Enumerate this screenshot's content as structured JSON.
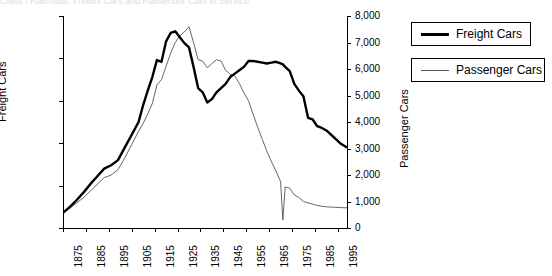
{
  "title_clipped": "Class I Railroads: Freight Cars and Passenger Cars in Service",
  "axes": {
    "left_title": "Freight Cars",
    "right_title": "Passenger Cars",
    "left_ticks": [
      "250,000",
      "200,000",
      "150,000",
      "100,000",
      "50,000",
      "0"
    ],
    "right_ticks": [
      "8,000",
      "7,000",
      "6,000",
      "5,000",
      "4,000",
      "3,000",
      "2,000",
      "1,000",
      "0"
    ],
    "x_ticks": [
      "1875",
      "1885",
      "1895",
      "1905",
      "1915",
      "1925",
      "1935",
      "1945",
      "1955",
      "1965",
      "1975",
      "1985",
      "1995"
    ]
  },
  "legend": {
    "items": [
      {
        "label": "Freight Cars",
        "swatch": "thick-black-line",
        "color": "#000000"
      },
      {
        "label": "Passenger Cars",
        "swatch": "thin-gray-line",
        "color": "#555555"
      }
    ]
  },
  "chart_data": {
    "type": "line",
    "title": "Class I Railroads: Freight Cars and Passenger Cars in Service",
    "xlabel": "",
    "ylabel": "Freight Cars",
    "y2label": "Passenger Cars",
    "xlim": [
      1875,
      1999
    ],
    "ylim": [
      0,
      250000
    ],
    "y2lim": [
      0,
      8000
    ],
    "grid": false,
    "legend_position": "right-outside",
    "x": [
      1875,
      1878,
      1881,
      1884,
      1887,
      1890,
      1893,
      1896,
      1899,
      1902,
      1905,
      1908,
      1910,
      1912,
      1914,
      1916,
      1918,
      1920,
      1922,
      1924,
      1926,
      1928,
      1930,
      1932,
      1934,
      1936,
      1938,
      1940,
      1942,
      1944,
      1946,
      1948,
      1950,
      1952,
      1954,
      1956,
      1958,
      1960,
      1962,
      1964,
      1966,
      1968,
      1970,
      1971,
      1972,
      1974,
      1976,
      1978,
      1980,
      1982,
      1984,
      1986,
      1988,
      1990,
      1992,
      1994,
      1996,
      1999
    ],
    "series": [
      {
        "name": "Freight Cars",
        "axis": "left",
        "style": "thick-black-line",
        "values": [
          18000,
          25000,
          33000,
          42000,
          52000,
          61000,
          70000,
          74000,
          80000,
          95000,
          110000,
          125000,
          145000,
          162000,
          178000,
          198000,
          196000,
          220000,
          230000,
          232000,
          225000,
          218000,
          213000,
          190000,
          165000,
          160000,
          148000,
          152000,
          160000,
          165000,
          170000,
          178000,
          182000,
          186000,
          190000,
          197000,
          197000,
          196000,
          195000,
          194000,
          195000,
          196000,
          194000,
          193000,
          190000,
          185000,
          170000,
          162000,
          155000,
          130000,
          128000,
          120000,
          118000,
          115000,
          110000,
          105000,
          100000,
          95000
        ]
      },
      {
        "name": "Passenger Cars",
        "axis": "right",
        "style": "thin-gray-line",
        "values": [
          600,
          750,
          950,
          1150,
          1400,
          1650,
          1900,
          2000,
          2200,
          2650,
          3150,
          3650,
          3950,
          4300,
          4700,
          5400,
          5600,
          6100,
          6600,
          7000,
          7250,
          7400,
          7600,
          7000,
          6350,
          6300,
          6050,
          6200,
          6350,
          6300,
          5950,
          5800,
          5750,
          5450,
          5100,
          4800,
          4300,
          3800,
          3350,
          2900,
          2500,
          2150,
          1750,
          300,
          1550,
          1500,
          1250,
          1150,
          1000,
          950,
          900,
          850,
          820,
          800,
          790,
          780,
          770,
          760
        ]
      }
    ],
    "annotations": [
      {
        "text": "Freight peak ~232,000 cars",
        "x": 1924
      },
      {
        "text": "Passenger peak ~7,600 cars",
        "x": 1930
      },
      {
        "text": "Freight trough ~148,000 cars",
        "x": 1938
      },
      {
        "text": "Sharp passenger drop to ~300 at Amtrak transition",
        "x": 1971
      }
    ]
  }
}
